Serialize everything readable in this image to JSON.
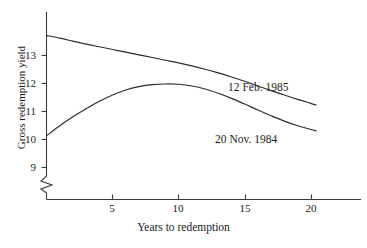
{
  "chart_data": {
    "type": "line",
    "title": "",
    "xlabel": "Years to redemption",
    "ylabel": "Gross redemption yield",
    "xlim": [
      0,
      23.8
    ],
    "ylim": [
      8.55,
      13.45
    ],
    "grid": false,
    "legend_position": "inline-annotations",
    "y_axis_break": true,
    "x_ticks": [
      5,
      10,
      15,
      20
    ],
    "x_tick_labels": [
      "5",
      "10",
      "15",
      "20"
    ],
    "y_ticks": [
      9,
      10,
      11,
      12,
      13
    ],
    "y_tick_labels": [
      "9",
      "10",
      "11",
      "12",
      "13"
    ],
    "series": [
      {
        "name": "12 Feb. 1985",
        "label": "12 Feb. 1985",
        "color": "#2b2b2b",
        "x": [
          0,
          1,
          2,
          3,
          4,
          5,
          6,
          7,
          8,
          9,
          10,
          11,
          12,
          13,
          14,
          15,
          16,
          17,
          18,
          19,
          20,
          20.4
        ],
        "values": [
          12.75,
          12.67,
          12.58,
          12.49,
          12.41,
          12.33,
          12.25,
          12.17,
          12.09,
          12.01,
          11.93,
          11.84,
          11.74,
          11.63,
          11.51,
          11.38,
          11.24,
          11.1,
          10.97,
          10.84,
          10.72,
          10.67
        ]
      },
      {
        "name": "20 Nov. 1984",
        "label": "20 Nov. 1984",
        "color": "#2b2b2b",
        "x": [
          0,
          1,
          2,
          3,
          4,
          5,
          6,
          7,
          8,
          9,
          10,
          11,
          12,
          13,
          14,
          15,
          16,
          17,
          18,
          19,
          20,
          20.4
        ],
        "values": [
          9.75,
          10.05,
          10.32,
          10.56,
          10.78,
          10.97,
          11.12,
          11.22,
          11.28,
          11.3,
          11.29,
          11.24,
          11.15,
          11.02,
          10.87,
          10.7,
          10.52,
          10.35,
          10.19,
          10.05,
          9.94,
          9.9
        ]
      }
    ]
  },
  "axis": {
    "y_title": "Gross redemption yield",
    "x_title": "Years to redemption",
    "y_tick_13": "13",
    "y_tick_12": "12",
    "y_tick_11": "11",
    "y_tick_10": "10",
    "y_tick_9": "9",
    "x_tick_5": "5",
    "x_tick_10": "10",
    "x_tick_15": "15",
    "x_tick_20": "20"
  },
  "annotations": {
    "upper_curve": "12 Feb. 1985",
    "lower_curve": "20 Nov. 1984"
  },
  "colors": {
    "line": "#2b2b2b",
    "axis": "#3a3a3a",
    "text": "#1a1a1a",
    "background": "#ffffff"
  }
}
